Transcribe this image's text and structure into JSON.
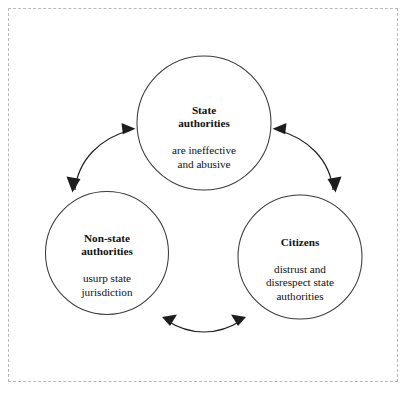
{
  "diagram": {
    "type": "cycle-diagram",
    "frame": {
      "style": "dashed",
      "color": "#b9b9b9"
    },
    "nodes": [
      {
        "id": "state-authorities",
        "title": "State\nauthorities",
        "description": "are ineffective\nand abusive",
        "position": "top"
      },
      {
        "id": "non-state-authorities",
        "title": "Non-state\nauthorities",
        "description": "usurp state\njurisdiction",
        "position": "bottom-left"
      },
      {
        "id": "citizens",
        "title": "Citizens",
        "description": "distrust and\ndisrespect state\nauthorities",
        "position": "bottom-right"
      }
    ],
    "connectors": [
      {
        "id": "state-to-nonstate",
        "from": "state-authorities",
        "to": "non-state-authorities",
        "style": "curved",
        "heads": "both"
      },
      {
        "id": "state-to-citizens",
        "from": "state-authorities",
        "to": "citizens",
        "style": "curved",
        "heads": "both"
      },
      {
        "id": "nonstate-to-citizens",
        "from": "non-state-authorities",
        "to": "citizens",
        "style": "curved",
        "heads": "both"
      }
    ],
    "colors": {
      "circle_stroke": "#3a3a3a",
      "arrow": "#1d1d1d",
      "text": "#111111",
      "background": "#ffffff"
    }
  }
}
